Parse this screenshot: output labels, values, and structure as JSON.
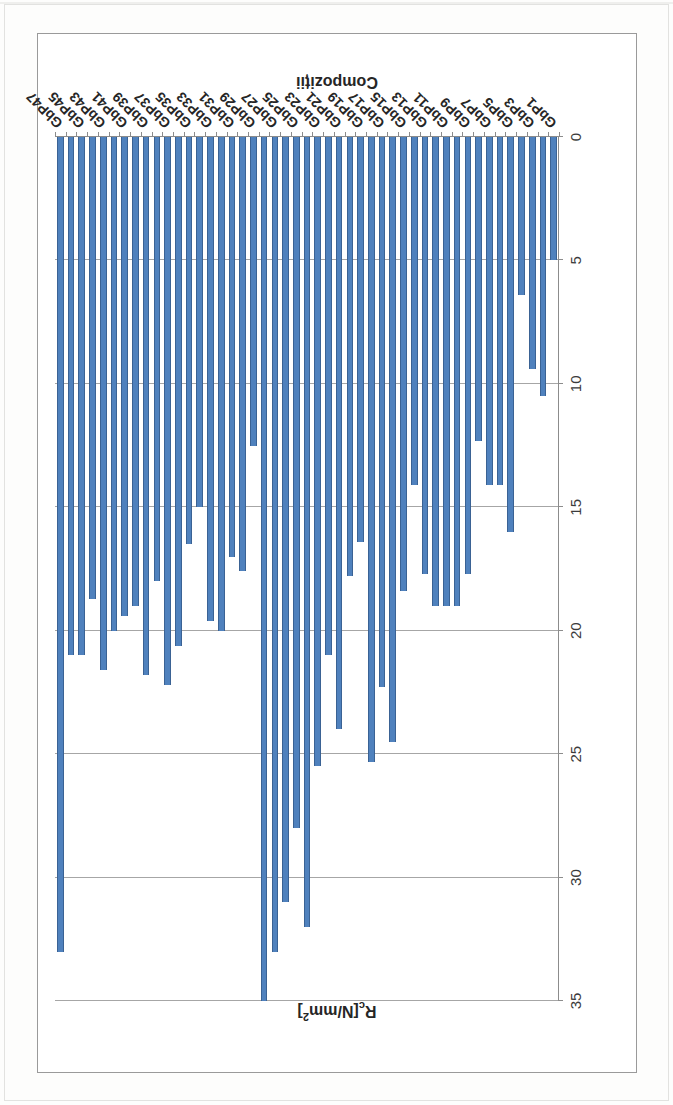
{
  "chart_data": {
    "type": "bar",
    "orientation": "horizontal",
    "title": "",
    "xlabel": "Rc [N/mm2]",
    "ylabel": "Compozitii",
    "value_axis_title_main": "R",
    "value_axis_title_sub": "c",
    "value_axis_title_unit": "[N/mm",
    "value_axis_title_sup": "2",
    "value_axis_title_close": "]",
    "category_axis_title": "Compoziții",
    "xlim": [
      0,
      35
    ],
    "ticks": [
      0,
      5,
      10,
      15,
      20,
      25,
      30,
      35
    ],
    "tick_labels": [
      "0",
      "5",
      "10",
      "15",
      "20",
      "25",
      "30",
      "35"
    ],
    "grid": true,
    "grid_axis": "value",
    "legend": false,
    "bar_color": "#4f81bd",
    "bar_border_color": "#3a6294",
    "axis_color": "#8c8c8c",
    "gridline_color": "#a6a6a6",
    "categories": [
      "GbP1",
      "GbP2",
      "GbP3",
      "GbP4",
      "GbP5",
      "GbP6",
      "GbP7",
      "GbP8",
      "GbP9",
      "GbP10",
      "GbP11",
      "GbP12",
      "GbP13",
      "GbP14",
      "GbP15",
      "GbP16",
      "GbP17",
      "GbP18",
      "GbP19",
      "GbP20",
      "GbP21",
      "GbP22",
      "GbP23",
      "GbP24",
      "GbP25",
      "GbP26",
      "GbP27",
      "GbP28",
      "GbP29",
      "GbP30",
      "GbP31",
      "GbP32",
      "GbP33",
      "GbP34",
      "GbP35",
      "GbP36",
      "GbP37",
      "GbP38",
      "GbP39",
      "GbP40",
      "GbP41",
      "GbP42",
      "GbP43",
      "GbP44",
      "GbP45",
      "GbP46",
      "GbP47"
    ],
    "visible_tick_labels": [
      "GbP1",
      "GbP3",
      "GbP5",
      "GbP7",
      "GbP9",
      "GbP11",
      "GbP13",
      "GbP15",
      "GbP17",
      "GbP19",
      "GbP21",
      "GbP23",
      "GbP25",
      "GbP27",
      "GbP29",
      "GbP31",
      "GbP33",
      "GbP35",
      "GbP37",
      "GbP39",
      "GbP41",
      "GbP43",
      "GbP45",
      "GbP47"
    ],
    "values": [
      5.0,
      10.5,
      9.4,
      6.4,
      16.0,
      14.1,
      14.1,
      12.3,
      17.7,
      19.0,
      19.0,
      19.0,
      17.7,
      14.1,
      18.4,
      24.5,
      22.3,
      25.3,
      16.4,
      17.8,
      24.0,
      21.0,
      25.5,
      32.0,
      28.0,
      31.0,
      33.0,
      35.0,
      12.5,
      17.6,
      17.0,
      20.0,
      19.6,
      15.0,
      16.5,
      20.6,
      22.2,
      18.0,
      21.8,
      19.0,
      19.4,
      20.0,
      21.6,
      18.7,
      21.0,
      21.0,
      33.0
    ]
  }
}
